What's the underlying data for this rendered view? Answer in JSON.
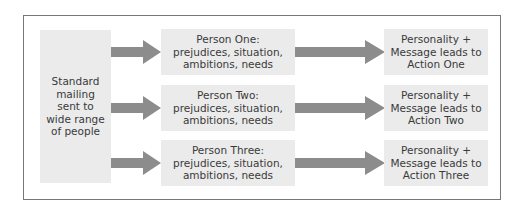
{
  "diagram": {
    "source": {
      "label": "Standard mailing sent to wide range of people"
    },
    "rows": [
      {
        "person": "Person One: prejudices, situation, ambitions, needs",
        "person_title": "Person One:",
        "person_detail_1": "prejudices, situation,",
        "person_detail_2": "ambitions, needs",
        "result_1": "Personality +",
        "result_2": "Message leads to",
        "result_3": "Action One"
      },
      {
        "person": "Person Two: prejudices, situation, ambitions, needs",
        "person_title": "Person Two:",
        "person_detail_1": "prejudices, situation,",
        "person_detail_2": "ambitions, needs",
        "result_1": "Personality +",
        "result_2": "Message leads to",
        "result_3": "Action Two"
      },
      {
        "person": "Person Three: prejudices, situation, ambitions, needs",
        "person_title": "Person Three:",
        "person_detail_1": "prejudices, situation,",
        "person_detail_2": "ambitions, needs",
        "result_1": "Personality +",
        "result_2": "Message leads to",
        "result_3": "Action Three"
      }
    ],
    "colors": {
      "box_fill": "#ebebeb",
      "arrow_fill": "#8c8c8c",
      "frame_border": "#777777",
      "text": "#3a3a3a"
    }
  }
}
